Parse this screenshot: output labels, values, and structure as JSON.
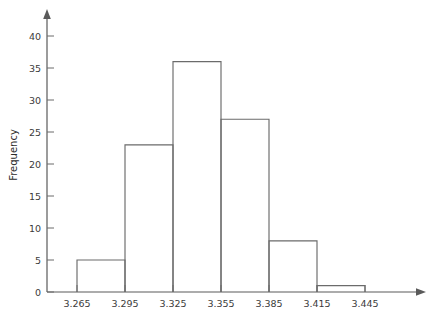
{
  "chart_data": {
    "type": "bar",
    "title": "",
    "subtitle": "",
    "xlabel": "",
    "ylabel": "Frequency",
    "grid": false,
    "legend": null,
    "bin_width": 0.03,
    "bin_edges": [
      3.265,
      3.295,
      3.325,
      3.355,
      3.385,
      3.415,
      3.445
    ],
    "categories": [
      "3.265-3.295",
      "3.295-3.325",
      "3.325-3.355",
      "3.355-3.385",
      "3.385-3.415",
      "3.415-3.445"
    ],
    "values": [
      5,
      23,
      36,
      27,
      8,
      1
    ],
    "xlim": [
      3.25,
      3.46
    ],
    "ylim": [
      0,
      42
    ],
    "x_ticks": [
      "3.265",
      "3.295",
      "3.325",
      "3.355",
      "3.385",
      "3.415",
      "3.445"
    ],
    "x_tick_values": [
      3.265,
      3.295,
      3.325,
      3.355,
      3.385,
      3.415,
      3.445
    ],
    "y_ticks": [
      "0",
      "5",
      "10",
      "15",
      "20",
      "25",
      "30",
      "35",
      "40"
    ],
    "y_tick_values": [
      0,
      5,
      10,
      15,
      20,
      25,
      30,
      35,
      40
    ],
    "bar_fill": "#ffffff",
    "bar_stroke": "#6b6b6b",
    "axis_color": "#5a5a5a",
    "background": "#ffffff",
    "axis_arrows": true
  },
  "axes": {
    "y_title": "Frequency",
    "x_title": ""
  }
}
